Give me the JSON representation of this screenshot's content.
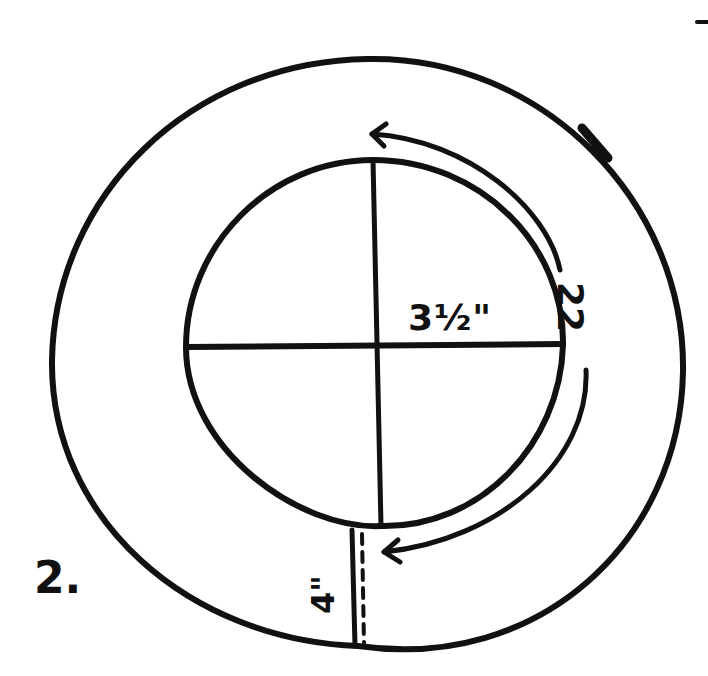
{
  "diagram": {
    "kind": "hand-drawn sewing pattern sketch",
    "step_label": "2.",
    "labels": {
      "radius": "3½\"",
      "circumference": "22",
      "strip_length": "4\""
    },
    "colors": {
      "ink": "#111111",
      "paper": "#ffffff"
    },
    "shapes": {
      "outer_circle": {
        "cx": 367,
        "cy": 364,
        "rx": 316,
        "ry": 305
      },
      "inner_circle": {
        "cx": 375,
        "cy": 345,
        "rx": 190,
        "ry": 185
      },
      "horizontal_diameter": {
        "x1": 186,
        "y1": 347,
        "x2": 563,
        "y2": 344
      },
      "vertical_diameter": {
        "x1": 373,
        "y1": 160,
        "x2": 381,
        "y2": 526
      },
      "strip_solid_edge": {
        "x1": 352,
        "y1": 530,
        "x2": 355,
        "y2": 646
      },
      "strip_dashed_edge": {
        "x1": 362,
        "y1": 532,
        "x2": 364,
        "y2": 644
      },
      "circumference_arrow": {
        "start": "top of inner circle",
        "end": "bottom of inner circle",
        "arrowheads": "both ends"
      },
      "tick_mark_outer": {
        "x": 578,
        "y": 135
      },
      "corner_mark": {
        "x": 700,
        "y": 22
      }
    }
  }
}
